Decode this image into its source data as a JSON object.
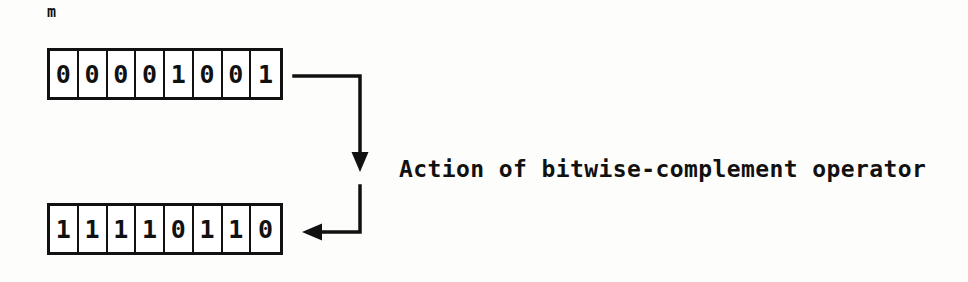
{
  "diagram": {
    "title": "Action of bitwise-complement operator",
    "variable_label": "m",
    "caption": "Action of bitwise-complement operator",
    "colors": {
      "ink": "#111111",
      "background": "#fdfdfc",
      "cell_fill": "#ffffff"
    },
    "input_row": {
      "name": "m",
      "bits": [
        "0",
        "0",
        "0",
        "0",
        "1",
        "0",
        "0",
        "1"
      ]
    },
    "output_row": {
      "name": "~m",
      "bits": [
        "1",
        "1",
        "1",
        "1",
        "0",
        "1",
        "1",
        "0"
      ]
    },
    "arrows": [
      {
        "name": "down-arrow",
        "direction": "down"
      },
      {
        "name": "left-arrow",
        "direction": "left"
      }
    ]
  }
}
